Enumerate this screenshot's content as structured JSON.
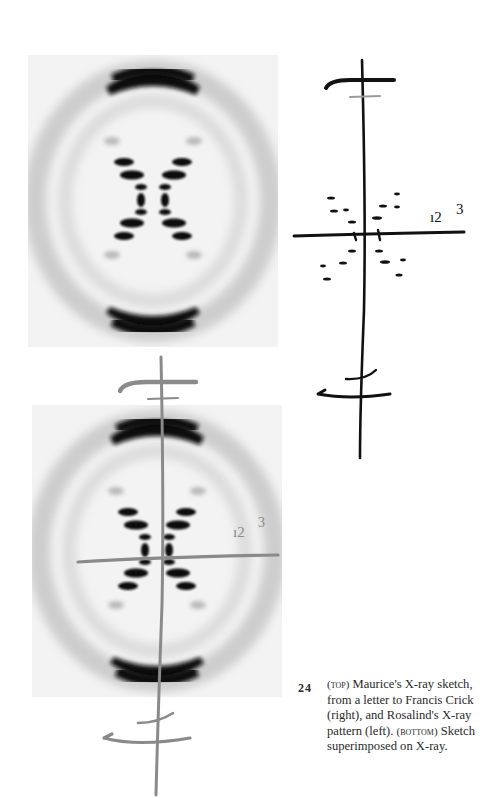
{
  "figure": {
    "number": "24",
    "caption": {
      "label_top": "(top)",
      "text_1": " Maurice's X-ray sketch, from a letter to Francis Crick (right), and Rosalind's X-ray pattern (left). ",
      "label_bottom": "(bottom)",
      "text_2": " Sketch superimposed on X-ray."
    },
    "panels": [
      {
        "id": "xray-photo",
        "description": "Rosalind's X-ray diffraction pattern"
      },
      {
        "id": "sketch",
        "description": "Maurice's hand-drawn X-ray sketch",
        "annotation": "1 2 3"
      },
      {
        "id": "overlay",
        "description": "Sketch superimposed on X-ray",
        "annotation": "1 2 3"
      }
    ]
  },
  "colors": {
    "ink": "#111111",
    "overlay_ink": "#8a8a8a",
    "film_dark": "#0c0c0c",
    "film_bg": "#f1f1f1"
  }
}
